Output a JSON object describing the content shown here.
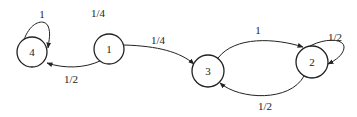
{
  "diagram": {
    "type": "markov-chain-state-diagram",
    "colors": {
      "stroke": "#222222",
      "background": "#ffffff",
      "text": "#222222"
    },
    "nodes": [
      {
        "id": "4",
        "label": "4",
        "cx": 32,
        "cy": 52,
        "r": 15
      },
      {
        "id": "1",
        "label": "1",
        "cx": 109,
        "cy": 49,
        "r": 15
      },
      {
        "id": "3",
        "label": "3",
        "cx": 208,
        "cy": 71,
        "r": 16
      },
      {
        "id": "2",
        "label": "2",
        "cx": 312,
        "cy": 62,
        "r": 16
      }
    ],
    "edges": [
      {
        "from": "4",
        "to": "4",
        "label": "1",
        "label_x": 42,
        "label_y": 18
      },
      {
        "from": "1",
        "to": "1",
        "label": "1/4",
        "label_x": 98,
        "label_y": 17
      },
      {
        "from": "1",
        "to": "3",
        "label": "1/4",
        "label_x": 158,
        "label_y": 44
      },
      {
        "from": "1",
        "to": "4",
        "label": "1/2",
        "label_x": 71,
        "label_y": 83
      },
      {
        "from": "3",
        "to": "2",
        "label": "1",
        "label_x": 258,
        "label_y": 34
      },
      {
        "from": "2",
        "to": "2",
        "label": "1/2",
        "label_x": 335,
        "label_y": 41
      },
      {
        "from": "2",
        "to": "3",
        "label": "1/2",
        "label_x": 265,
        "label_y": 110
      }
    ]
  }
}
